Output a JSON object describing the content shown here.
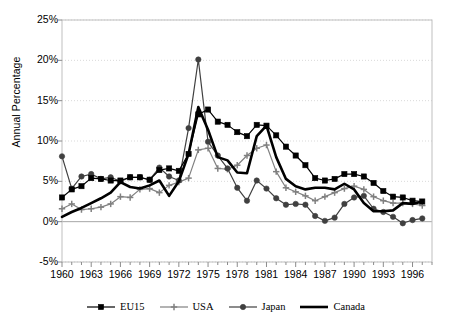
{
  "chart_data": {
    "type": "line",
    "title": "",
    "xlabel": "",
    "ylabel": "Annual Percentage",
    "xlim": [
      1960,
      1998
    ],
    "ylim": [
      -5,
      25
    ],
    "ytick_labels": [
      "25%",
      "20%",
      "15%",
      "10%",
      "5%",
      "0%",
      "-5%"
    ],
    "ytick_values": [
      25,
      20,
      15,
      10,
      5,
      0,
      -5
    ],
    "xtick_labels": [
      "1960",
      "1963",
      "1966",
      "1969",
      "1972",
      "1975",
      "1978",
      "1981",
      "1984",
      "1987",
      "1990",
      "1993",
      "1996"
    ],
    "xtick_values": [
      1960,
      1963,
      1966,
      1969,
      1972,
      1975,
      1978,
      1981,
      1984,
      1987,
      1990,
      1993,
      1996
    ],
    "grid": true,
    "legend_position": "bottom",
    "x": [
      1960,
      1961,
      1962,
      1963,
      1964,
      1965,
      1966,
      1967,
      1968,
      1969,
      1970,
      1971,
      1972,
      1973,
      1974,
      1975,
      1976,
      1977,
      1978,
      1979,
      1980,
      1981,
      1982,
      1983,
      1984,
      1985,
      1986,
      1987,
      1988,
      1989,
      1990,
      1991,
      1992,
      1993,
      1994,
      1995,
      1996,
      1997
    ],
    "series": [
      {
        "name": "EU15",
        "marker": "square",
        "color": "#000000",
        "line_width": 1.2,
        "values": [
          3.0,
          4.0,
          4.4,
          5.4,
          5.3,
          5.1,
          5.1,
          5.5,
          5.5,
          5.2,
          6.4,
          6.6,
          6.3,
          8.4,
          13.3,
          13.9,
          12.4,
          12.0,
          11.1,
          10.6,
          12.0,
          11.9,
          10.7,
          9.3,
          8.2,
          7.0,
          5.4,
          5.1,
          5.3,
          5.9,
          5.9,
          5.6,
          4.8,
          3.8,
          3.1,
          3.0,
          2.6,
          2.5
        ]
      },
      {
        "name": "USA",
        "marker": "cross",
        "color": "#808080",
        "line_width": 1.2,
        "values": [
          1.6,
          2.2,
          1.5,
          1.6,
          1.8,
          2.2,
          3.1,
          3.0,
          4.0,
          4.1,
          3.6,
          4.5,
          4.9,
          5.4,
          8.9,
          9.1,
          6.6,
          6.5,
          7.0,
          8.2,
          9.1,
          9.5,
          6.2,
          4.2,
          3.7,
          3.2,
          2.6,
          3.1,
          3.6,
          4.1,
          4.4,
          4.0,
          3.1,
          2.6,
          2.3,
          2.3,
          2.2,
          2.0
        ]
      },
      {
        "name": "Japan",
        "marker": "circle",
        "color": "#404040",
        "line_width": 1.2,
        "values": [
          8.1,
          4.1,
          5.6,
          5.9,
          5.3,
          5.5,
          5.0,
          5.5,
          5.5,
          5.2,
          6.7,
          5.6,
          5.1,
          11.6,
          20.1,
          9.9,
          8.2,
          6.6,
          4.2,
          2.6,
          5.1,
          4.1,
          2.9,
          2.1,
          2.2,
          2.1,
          0.7,
          0.1,
          0.5,
          2.2,
          3.0,
          3.2,
          1.6,
          1.2,
          0.6,
          -0.2,
          0.2,
          0.4
        ]
      },
      {
        "name": "Canada",
        "marker": "none",
        "color": "#000000",
        "line_width": 2.6,
        "values": [
          0.6,
          1.2,
          1.7,
          2.3,
          2.9,
          3.6,
          4.9,
          4.3,
          4.1,
          4.5,
          5.1,
          3.2,
          5.0,
          8.4,
          14.2,
          11.4,
          8.0,
          7.6,
          6.1,
          6.0,
          10.6,
          11.9,
          8.0,
          5.3,
          4.4,
          4.0,
          4.2,
          4.2,
          4.0,
          4.7,
          4.0,
          2.3,
          1.3,
          1.3,
          1.4,
          2.3,
          2.2,
          2.5
        ]
      }
    ]
  },
  "legend": {
    "items": [
      {
        "label": "EU15",
        "marker": "square"
      },
      {
        "label": "USA",
        "marker": "cross"
      },
      {
        "label": "Japan",
        "marker": "circle"
      },
      {
        "label": "Canada",
        "marker": "none"
      }
    ]
  },
  "colors": {
    "plot_border": "#bfbfbf",
    "grid": "#d9d9d9",
    "zero_axis": "#a6a6a6",
    "eu15": "#000000",
    "usa": "#808080",
    "japan": "#404040",
    "canada": "#000000",
    "background": "#ffffff"
  }
}
